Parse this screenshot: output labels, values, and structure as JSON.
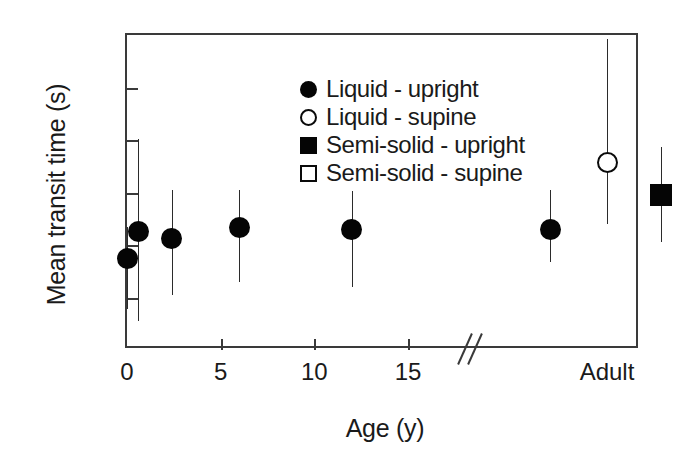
{
  "chart_data": {
    "type": "scatter",
    "title": "",
    "xlabel": "Age (y)",
    "ylabel": "Mean transit time (s)",
    "xlim": [
      0,
      15
    ],
    "ylim": [
      0,
      12
    ],
    "yticks": [
      0,
      2,
      4,
      6,
      8,
      10,
      12
    ],
    "xticks": [
      0,
      5,
      10,
      15
    ],
    "grid": false,
    "axis_break": {
      "present": true,
      "style": "double-slash",
      "after_tick": 15,
      "label_after_break": "Adult"
    },
    "legend": {
      "position": "top-left-inside",
      "entries": [
        {
          "label": "Liquid - upright",
          "marker": "circle-filled"
        },
        {
          "label": "Liquid - supine",
          "marker": "circle-open"
        },
        {
          "label": "Semi-solid - upright",
          "marker": "square-filled"
        },
        {
          "label": "Semi-solid - supine",
          "marker": "square-open"
        }
      ]
    },
    "series": [
      {
        "name": "Liquid - upright",
        "marker": "circle-filled",
        "points": [
          {
            "x": 0.0,
            "y": 3.5,
            "yerr_low": 1.55,
            "yerr_high": 4.7,
            "group": "age"
          },
          {
            "x": 0.6,
            "y": 4.5,
            "yerr_low": 1.1,
            "yerr_high": 8.05,
            "group": "age"
          },
          {
            "x": 2.4,
            "y": 4.25,
            "yerr_low": 2.1,
            "yerr_high": 6.1,
            "group": "age"
          },
          {
            "x": 6.0,
            "y": 4.65,
            "yerr_low": 2.6,
            "yerr_high": 6.1,
            "group": "age"
          },
          {
            "x": 12.0,
            "y": 4.6,
            "yerr_low": 2.4,
            "yerr_high": 6.05,
            "group": "age"
          },
          {
            "x": null,
            "y": 4.6,
            "yerr_low": 3.35,
            "yerr_high": 6.1,
            "group": "adult",
            "adult_slot": 0
          }
        ]
      },
      {
        "name": "Liquid - supine",
        "marker": "circle-open",
        "points": [
          {
            "x": null,
            "y": 7.15,
            "yerr_low": 4.8,
            "yerr_high": 11.85,
            "group": "adult",
            "adult_slot": 1
          }
        ]
      },
      {
        "name": "Semi-solid - upright",
        "marker": "square-filled",
        "points": [
          {
            "x": null,
            "y": 5.9,
            "yerr_low": 4.1,
            "yerr_high": 7.75,
            "group": "adult",
            "adult_slot": 2
          }
        ]
      },
      {
        "name": "Semi-solid - supine",
        "marker": "square-open",
        "points": [
          {
            "x": null,
            "y": 8.2,
            "yerr_low": 6.85,
            "yerr_high": 9.6,
            "group": "adult",
            "adult_slot": 3
          }
        ]
      }
    ]
  },
  "axes": {
    "ytick_labels": [
      "0",
      "2",
      "4",
      "6",
      "8",
      "10",
      "12"
    ],
    "xtick_labels": [
      "0",
      "5",
      "10",
      "15"
    ],
    "adult_label": "Adult"
  },
  "colors": {
    "axis": "#3a3a3a",
    "marker_fill": "#050505",
    "marker_open_fill": "#ffffff",
    "error_bar": "#2b2b2b",
    "background": "#ffffff",
    "text": "#1a1a1a"
  }
}
